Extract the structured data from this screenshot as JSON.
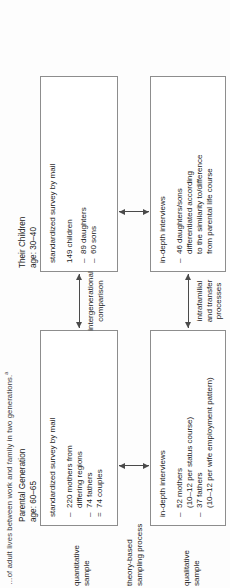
{
  "figure": {
    "title": "…of adult lives between work and family in two generations.",
    "title_superscript": "a",
    "columns": [
      {
        "name": "Parental Generation",
        "age": "age: 60–65"
      },
      {
        "name": "Their Children",
        "age": "age: 30–40"
      }
    ],
    "row_labels": {
      "quantitative": "quantitative\nsample",
      "quantitative_l1": "quantitative",
      "quantitative_l2": "sample",
      "sampling_l1": "theory-based",
      "sampling_l2": "sampling process",
      "qualitative_l1": "qualitative",
      "qualitative_l2": "sample"
    },
    "boxes": {
      "quant_parent": {
        "method": "standardized survey by mail",
        "items": [
          {
            "marker": "–",
            "text": "220 mothers from"
          },
          {
            "marker": "",
            "text": "differing regions"
          },
          {
            "marker": "–",
            "text": "74 fathers"
          },
          {
            "marker": "=",
            "text": "74 couples"
          }
        ]
      },
      "quant_child": {
        "method": "standardized survey by mail",
        "subtotal": "149 children",
        "items": [
          {
            "marker": "–",
            "text": "89 daughters"
          },
          {
            "marker": "–",
            "text": "60 sons"
          }
        ]
      },
      "interview_parent": {
        "method": "in-depth interviews",
        "items": [
          {
            "marker": "–",
            "text": "52 mothers"
          },
          {
            "marker": "",
            "text": "(10–12 per status course)"
          },
          {
            "marker": "–",
            "text": "37 fathers"
          },
          {
            "marker": "",
            "text": "(10–12 per wife employment pattern)"
          }
        ]
      },
      "interview_child": {
        "method": "in-depth interviews",
        "items": [
          {
            "marker": "–",
            "text": "46 daughters/sons"
          },
          {
            "marker": "",
            "text": "differentiated according"
          },
          {
            "marker": "",
            "text": "to the similarity to/difference"
          },
          {
            "marker": "",
            "text": "from parental life course"
          }
        ]
      }
    },
    "connectors": {
      "intergenerational_l1": "intergenerational",
      "intergenerational_l2": "comparison",
      "intrafamilial_l1": "intrafamilial",
      "intrafamilial_l2": "and transfer",
      "intrafamilial_l3": "processes"
    },
    "colors": {
      "box_border": "#8d8d8d",
      "arrow": "#4a4a4a",
      "text": "#222222",
      "background": "#fdfdfd"
    }
  }
}
